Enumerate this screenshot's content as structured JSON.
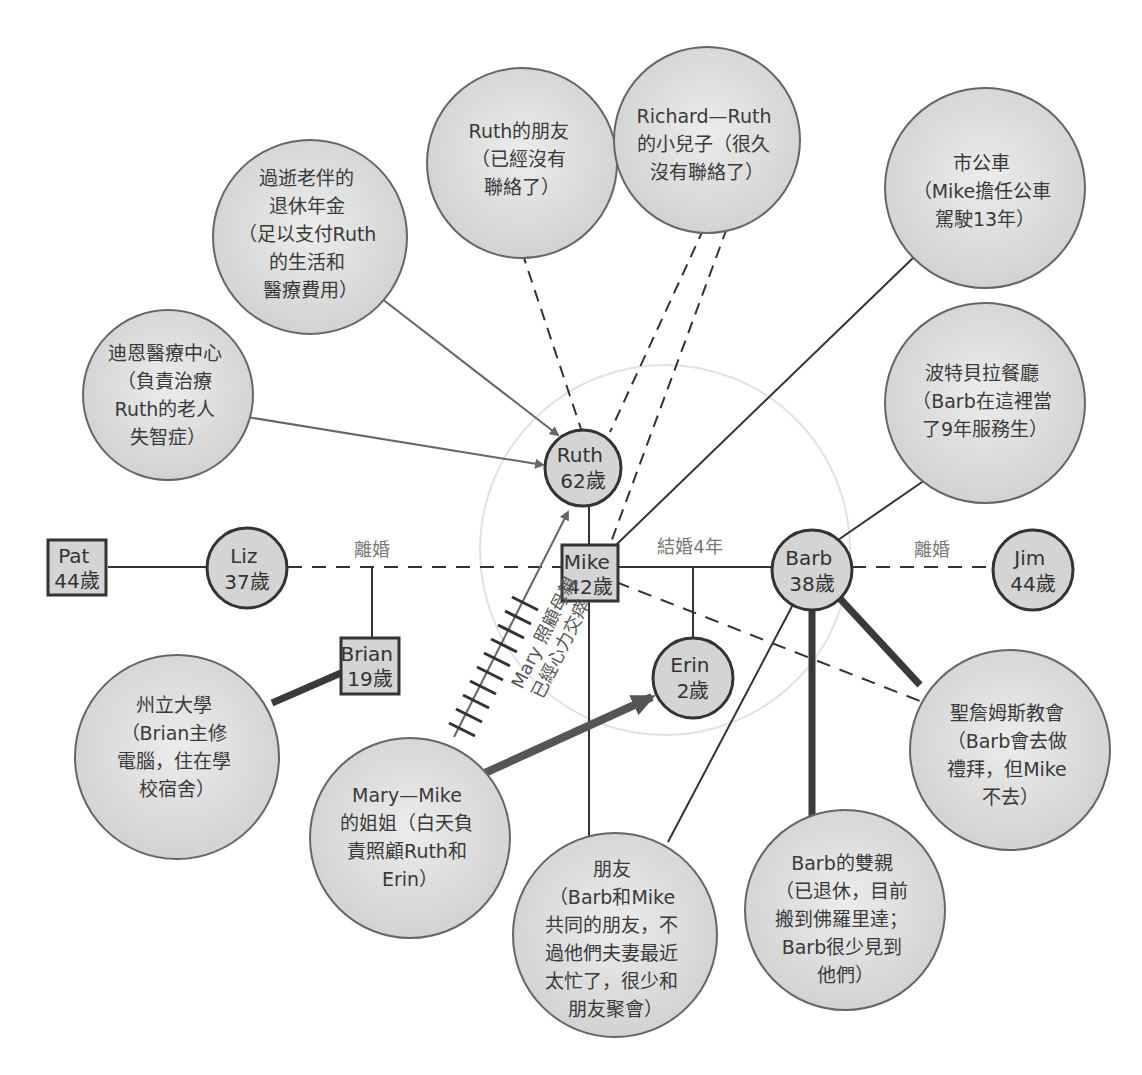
{
  "diagram": {
    "type": "ecomap",
    "colors": {
      "node_fill": "#d4d4d4",
      "resource_fill": "#dcdcdc",
      "stroke": "#333333",
      "arrow": "#666666",
      "strong_line": "#3a3a3a",
      "outer_ring": "#e4e4e4"
    },
    "people": {
      "pat": {
        "name": "Pat",
        "age": "44歲",
        "shape": "square"
      },
      "liz": {
        "name": "Liz",
        "age": "37歲",
        "shape": "circle"
      },
      "brian": {
        "name": "Brian",
        "age": "19歲",
        "shape": "square"
      },
      "ruth": {
        "name": "Ruth",
        "age": "62歲",
        "shape": "circle"
      },
      "mike": {
        "name": "Mike",
        "age": "42歲",
        "shape": "square"
      },
      "barb": {
        "name": "Barb",
        "age": "38歲",
        "shape": "circle"
      },
      "jim": {
        "name": "Jim",
        "age": "44歲",
        "shape": "circle"
      },
      "erin": {
        "name": "Erin",
        "age": "2歲",
        "shape": "circle"
      }
    },
    "relation_labels": {
      "liz_mike": "離婚",
      "mike_barb": "結婚4年",
      "barb_jim": "離婚",
      "mary_ruth_line1": "Mary 照顧母親",
      "mary_ruth_line2": "已經心力交瘁"
    },
    "resources": {
      "dean_medical": {
        "lines": [
          "迪恩醫療中心",
          "（負責治療",
          "Ruth的老人",
          "失智症）"
        ]
      },
      "pension": {
        "lines": [
          "過逝老伴的",
          "退休年金",
          "（足以支付Ruth",
          "的生活和",
          "醫療費用）"
        ]
      },
      "ruth_friends": {
        "lines": [
          "Ruth的朋友",
          "（已經沒有",
          "聯絡了）"
        ]
      },
      "richard": {
        "lines": [
          "Richard—Ruth",
          "的小兒子（很久",
          "沒有聯絡了）"
        ]
      },
      "city_bus": {
        "lines": [
          "市公車",
          "（Mike擔任公車",
          "駕駛13年）"
        ]
      },
      "restaurant": {
        "lines": [
          "波特貝拉餐廳",
          "（Barb在這裡當",
          "了9年服務生）"
        ]
      },
      "state_university": {
        "lines": [
          "州立大學",
          "（Brian主修",
          "電腦，住在學",
          "校宿舍）"
        ]
      },
      "mary": {
        "lines": [
          "Mary—Mike",
          "的姐姐（白天負",
          "責照顧Ruth和",
          "Erin）"
        ]
      },
      "friends": {
        "lines": [
          "朋友",
          "（Barb和Mike",
          "共同的朋友，不",
          "過他們夫妻最近",
          "太忙了，很少和",
          "朋友聚會）"
        ]
      },
      "barb_parents": {
        "lines": [
          "Barb的雙親",
          "（已退休，目前",
          "搬到佛羅里達；",
          "Barb很少見到",
          "他們）"
        ]
      },
      "st_james_church": {
        "lines": [
          "聖詹姆斯教會",
          "（Barb會去做",
          "禮拜，但Mike",
          "不去）"
        ]
      }
    }
  }
}
